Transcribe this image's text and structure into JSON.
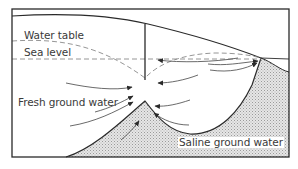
{
  "diagram": {
    "type": "cross-section",
    "labels": {
      "water_table": "Water table",
      "sea_level": "Sea level",
      "fresh_ground_water": "Fresh ground water",
      "saline_ground_water": "Saline ground water"
    },
    "elements": [
      {
        "id": "frame",
        "kind": "rectangle border"
      },
      {
        "id": "land-surface",
        "kind": "solid curve, sloping down toward sea"
      },
      {
        "id": "water-table",
        "kind": "dashed curve with cone of depression at well"
      },
      {
        "id": "sea-level",
        "kind": "dashed horizontal line"
      },
      {
        "id": "well",
        "kind": "vertical line"
      },
      {
        "id": "saline-interface",
        "kind": "solid curve with upconing peak under well"
      },
      {
        "id": "saline-zone",
        "kind": "stippled fill"
      },
      {
        "id": "flow-arrows",
        "kind": "curved arrows converging on well"
      }
    ],
    "colors": {
      "line": "#2a2a2a",
      "dash": "#8a8a8a",
      "stipple": "#c8c8c8",
      "text": "#3a3a3a",
      "background": "#ffffff"
    }
  }
}
